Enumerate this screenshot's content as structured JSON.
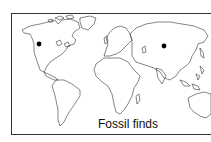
{
  "map": {
    "caption": "Fossil finds",
    "markers": [
      {
        "label": "fossil-find-north-america",
        "x": 39,
        "y": 44
      },
      {
        "label": "fossil-find-central-asia",
        "x": 164,
        "y": 46
      }
    ],
    "colors": {
      "outline": "#333333",
      "marker": "#000000",
      "background": "#ffffff"
    }
  }
}
